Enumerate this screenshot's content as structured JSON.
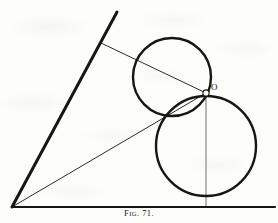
{
  "figure": {
    "caption_prefix": "F",
    "caption_small": "IG",
    "caption_number": ". 71.",
    "caption_full": "FIG. 71.",
    "point_label_o": "O",
    "background_color": "#fdfdfc",
    "ink_color": "#161616",
    "thin_ink_color": "#2b2b2b"
  },
  "geometry": {
    "type": "tangent-circles-in-angle",
    "angle_vertex": {
      "x": 12,
      "y": 207
    },
    "angle_upper_ray_end": {
      "x": 117,
      "y": 12
    },
    "angle_lower_ray_end": {
      "x": 275,
      "y": 207
    },
    "point_o": {
      "x": 206,
      "y": 93
    },
    "upper_circle": {
      "cx": 172,
      "cy": 77,
      "r": 39
    },
    "lower_circle": {
      "cx": 206,
      "cy": 146,
      "r": 50
    },
    "tangency_point_circles": {
      "x": 167,
      "y": 110
    },
    "tangency_point_upper_ray": {
      "x": 101,
      "y": 43
    },
    "tangency_point_baseline": {
      "x": 206,
      "y": 196
    },
    "radius_line_upper": {
      "x1": 101,
      "y1": 43,
      "x2": 206,
      "y2": 93
    },
    "radius_line_lower": {
      "x1": 12,
      "y1": 207,
      "x2": 206,
      "y2": 93
    },
    "vertical_line": {
      "x1": 206,
      "y1": 93,
      "x2": 206,
      "y2": 207
    },
    "stroke_width_thick": 3.0,
    "stroke_width_circle": 2.4,
    "stroke_width_thin": 1.0,
    "stroke_width_baseline": 2.2
  }
}
